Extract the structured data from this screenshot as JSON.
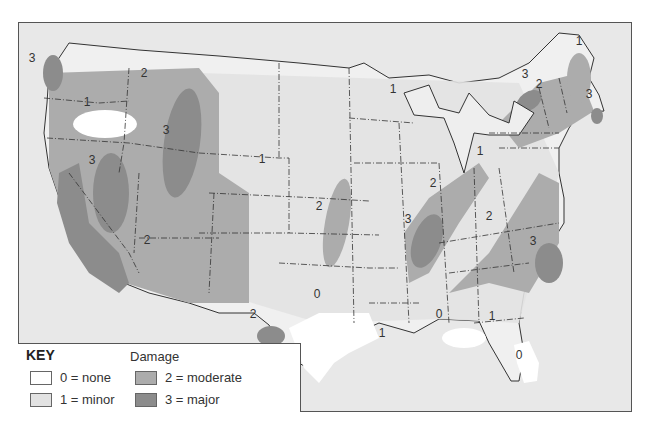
{
  "map": {
    "title": "Damage",
    "colors": {
      "background": "#e8e8e8",
      "none": "#ffffff",
      "minor": "#e2e2e2",
      "moderate": "#acacac",
      "major": "#8c8c8c",
      "border": "#333333"
    },
    "region_labels": [
      {
        "id": "wa-coast",
        "value": "3",
        "x": 31,
        "y": 57
      },
      {
        "id": "oregon-east",
        "value": "1",
        "x": 86,
        "y": 101
      },
      {
        "id": "idaho",
        "value": "2",
        "x": 143,
        "y": 72
      },
      {
        "id": "montana-west",
        "value": "3",
        "x": 165,
        "y": 129
      },
      {
        "id": "nevada",
        "value": "3",
        "x": 91,
        "y": 159
      },
      {
        "id": "arizona",
        "value": "2",
        "x": 146,
        "y": 239
      },
      {
        "id": "wyoming-nebraska",
        "value": "1",
        "x": 261,
        "y": 158
      },
      {
        "id": "kansas-oklahoma",
        "value": "2",
        "x": 318,
        "y": 205
      },
      {
        "id": "minnesota-wisconsin",
        "value": "1",
        "x": 392,
        "y": 88
      },
      {
        "id": "new-york",
        "value": "3",
        "x": 524,
        "y": 73
      },
      {
        "id": "new-england",
        "value": "2",
        "x": 538,
        "y": 83
      },
      {
        "id": "maine",
        "value": "1",
        "x": 578,
        "y": 40
      },
      {
        "id": "massachusetts",
        "value": "3",
        "x": 588,
        "y": 93
      },
      {
        "id": "ohio",
        "value": "1",
        "x": 479,
        "y": 150
      },
      {
        "id": "indiana-kentucky",
        "value": "2",
        "x": 432,
        "y": 182
      },
      {
        "id": "tennessee-west",
        "value": "3",
        "x": 407,
        "y": 218
      },
      {
        "id": "carolinas",
        "value": "2",
        "x": 488,
        "y": 215
      },
      {
        "id": "south-carolina",
        "value": "3",
        "x": 532,
        "y": 240
      },
      {
        "id": "texas",
        "value": "0",
        "x": 316,
        "y": 293
      },
      {
        "id": "texas-west",
        "value": "2",
        "x": 252,
        "y": 313
      },
      {
        "id": "louisiana",
        "value": "1",
        "x": 381,
        "y": 332
      },
      {
        "id": "alabama-coast",
        "value": "0",
        "x": 438,
        "y": 313
      },
      {
        "id": "georgia-south",
        "value": "1",
        "x": 491,
        "y": 315
      },
      {
        "id": "florida",
        "value": "0",
        "x": 518,
        "y": 354
      }
    ]
  },
  "key": {
    "title": "KEY",
    "subtitle": "Damage",
    "items": [
      {
        "label": "0 = none",
        "color": "#ffffff"
      },
      {
        "label": "1 = minor",
        "color": "#e2e2e2"
      },
      {
        "label": "2 = moderate",
        "color": "#acacac"
      },
      {
        "label": "3 = major",
        "color": "#8c8c8c"
      }
    ]
  }
}
